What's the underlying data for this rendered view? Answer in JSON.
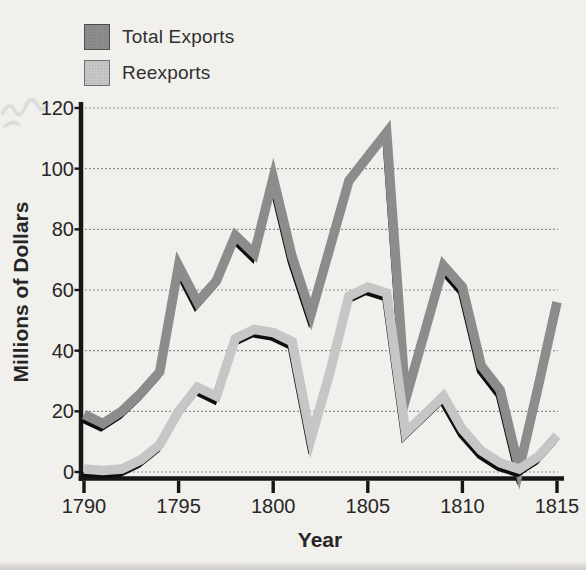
{
  "figure": {
    "background_color": "#f2f0ec",
    "axis_color": "#161616",
    "text_color": "#262626",
    "gridline_color": "#8d8d8d"
  },
  "chart_data": {
    "type": "line",
    "title": "",
    "xlabel": "Year",
    "ylabel": "Millions of Dollars",
    "xlim": [
      1790,
      1815
    ],
    "ylim": [
      0,
      120
    ],
    "grid": true,
    "legend_position": "top-left",
    "xticks": [
      1790,
      1795,
      1800,
      1805,
      1810,
      1815
    ],
    "yticks": [
      0,
      20,
      40,
      60,
      80,
      100,
      120
    ],
    "x": [
      1790,
      1791,
      1792,
      1793,
      1794,
      1795,
      1796,
      1797,
      1798,
      1799,
      1800,
      1801,
      1802,
      1803,
      1804,
      1805,
      1806,
      1807,
      1808,
      1809,
      1810,
      1811,
      1812,
      1813,
      1814,
      1815
    ],
    "series": [
      {
        "name": "Total Exports",
        "color": "#8c8c8c",
        "shadow_color": "#0e0e0e",
        "values": [
          19,
          16,
          20,
          26,
          33,
          68,
          56,
          63,
          78,
          72,
          97,
          71,
          52,
          74,
          96,
          104,
          112,
          24,
          46,
          68,
          61,
          35,
          27,
          1,
          28,
          56
        ]
      },
      {
        "name": "Reexports",
        "color": "#c6c6c6",
        "shadow_color": "#0e0e0e",
        "values": [
          1,
          0.5,
          1,
          4,
          9,
          20,
          28,
          25,
          44,
          47,
          46,
          43,
          11,
          33,
          58,
          61,
          59,
          13,
          19,
          25,
          14,
          7,
          3,
          1,
          5,
          12
        ]
      }
    ]
  }
}
